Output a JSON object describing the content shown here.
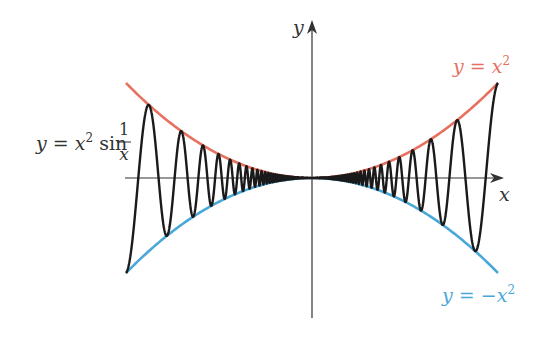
{
  "chart_data": {
    "type": "line",
    "title": "",
    "xlabel": "x",
    "ylabel": "y",
    "xlim": [
      -1,
      1
    ],
    "ylim": [
      -1.1,
      1.3
    ],
    "grid": false,
    "legend_position": "inline annotations",
    "series": [
      {
        "name": "y = x^2",
        "label_text": {
          "lhs": "y",
          "eq": " = ",
          "base": "x",
          "exp": "2"
        },
        "color": "#e8705f",
        "formula": "x^2",
        "x": [
          -1,
          -0.75,
          -0.5,
          -0.25,
          0,
          0.25,
          0.5,
          0.75,
          1
        ],
        "values": [
          1,
          0.5625,
          0.25,
          0.0625,
          0,
          0.0625,
          0.25,
          0.5625,
          1
        ]
      },
      {
        "name": "y = -x^2",
        "label_text": {
          "lhs": "y",
          "eq": " = ",
          "neg": "−",
          "base": "x",
          "exp": "2"
        },
        "color": "#4aa8d8",
        "formula": "-x^2",
        "x": [
          -1,
          -0.75,
          -0.5,
          -0.25,
          0,
          0.25,
          0.5,
          0.75,
          1
        ],
        "values": [
          -1,
          -0.5625,
          -0.25,
          -0.0625,
          0,
          -0.0625,
          -0.25,
          -0.5625,
          -1
        ]
      },
      {
        "name": "y = x^2 sin(1/x)",
        "label_text": {
          "lhs": "y",
          "eq": " = ",
          "base": "x",
          "exp": "2",
          "fn": " sin ",
          "num": "1",
          "den": "x"
        },
        "color": "#1a1a1a",
        "formula": "x^2 sin(1/x)",
        "note": "oscillates between y = x^2 and y = -x^2, with frequency increasing toward x = 0"
      }
    ],
    "annotations": [
      {
        "text": "y = x^2",
        "position": "upper right",
        "color": "#e8705f"
      },
      {
        "text": "y = -x^2",
        "position": "lower right",
        "color": "#4aa8d8"
      },
      {
        "text": "y = x^2 sin(1/x)",
        "position": "left",
        "color": "#333333"
      }
    ]
  },
  "axes": {
    "x_label": "x",
    "y_label": "y",
    "axis_color": "#333333"
  },
  "render": {
    "origin_px": [
      312,
      178
    ],
    "half_width_px": 186,
    "amplitude_px": 95,
    "phase_scale": 22.2
  }
}
